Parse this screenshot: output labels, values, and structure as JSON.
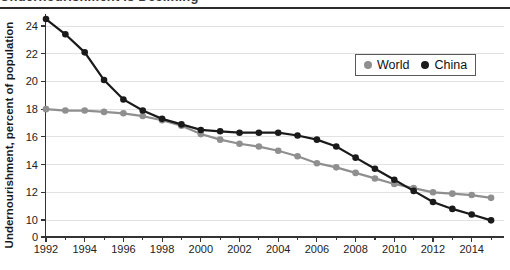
{
  "header": {
    "title": "Undernourishment Is Declining"
  },
  "chart_data": {
    "type": "line",
    "title": "Undernourishment Is Declining",
    "xlabel": "",
    "ylabel": "Undernourishment, percent of population",
    "x": [
      1992,
      1993,
      1994,
      1995,
      1996,
      1997,
      1998,
      1999,
      2000,
      2001,
      2002,
      2003,
      2004,
      2005,
      2006,
      2007,
      2008,
      2009,
      2010,
      2011,
      2012,
      2013,
      2014,
      2015
    ],
    "series": [
      {
        "name": "World",
        "color": "#8f8f8f",
        "values": [
          18.0,
          17.9,
          17.9,
          17.8,
          17.7,
          17.5,
          17.2,
          16.8,
          16.2,
          15.8,
          15.5,
          15.3,
          15.0,
          14.6,
          14.1,
          13.8,
          13.4,
          13.0,
          12.6,
          12.3,
          12.0,
          11.9,
          11.8,
          11.6
        ]
      },
      {
        "name": "China",
        "color": "#1a1a1a",
        "values": [
          24.5,
          23.4,
          22.1,
          20.1,
          18.7,
          17.9,
          17.3,
          16.9,
          16.5,
          16.4,
          16.3,
          16.3,
          16.3,
          16.1,
          15.8,
          15.3,
          14.5,
          13.7,
          12.9,
          12.1,
          11.3,
          10.8,
          10.4,
          9.8
        ]
      }
    ],
    "y_ticks": [
      0,
      10,
      12,
      14,
      16,
      18,
      20,
      22,
      24
    ],
    "x_tick_labels": [
      1992,
      1994,
      1996,
      1998,
      2000,
      2002,
      2004,
      2006,
      2008,
      2010,
      2012,
      2014
    ],
    "ylim": [
      0,
      25
    ],
    "y_axis_break": "compressed between 0 and 10",
    "grid": "horizontal",
    "legend_position": "inset top-right",
    "colors": {
      "grid": "#e2e2e2",
      "axis": "#333333"
    }
  }
}
